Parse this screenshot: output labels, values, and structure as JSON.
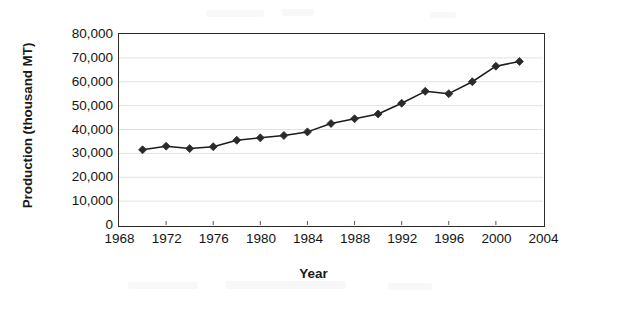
{
  "chart_data": {
    "type": "line",
    "title": "",
    "subtitle": "",
    "xlabel": "Year",
    "ylabel": "Production (thousand MT)",
    "xlim": [
      1968,
      2004
    ],
    "ylim": [
      0,
      80000
    ],
    "xticks": [
      1968,
      1972,
      1976,
      1980,
      1984,
      1988,
      1992,
      1996,
      2000,
      2004
    ],
    "xtick_labels": [
      "1968",
      "1972",
      "1976",
      "1980",
      "1984",
      "1988",
      "1992",
      "1996",
      "2000",
      "2004"
    ],
    "yticks": [
      0,
      10000,
      20000,
      30000,
      40000,
      50000,
      60000,
      70000,
      80000
    ],
    "ytick_labels": [
      "0",
      "10,000",
      "20,000",
      "30,000",
      "40,000",
      "50,000",
      "60,000",
      "70,000",
      "80,000"
    ],
    "grid": true,
    "grid_axis": "y",
    "legend": false,
    "legend_position": "none",
    "marker": "diamond",
    "line_color": "#1c1c1c",
    "marker_color": "#2a2a2a",
    "grid_color": "#e2e2e2",
    "axis_color": "#2b2b2b",
    "x": [
      1970,
      1972,
      1974,
      1976,
      1978,
      1980,
      1982,
      1984,
      1986,
      1988,
      1990,
      1992,
      1994,
      1996,
      1998,
      2000,
      2002
    ],
    "values": [
      31500,
      33000,
      32000,
      32800,
      35500,
      36500,
      37500,
      39000,
      42500,
      44500,
      46500,
      51000,
      56000,
      55000,
      60000,
      66500,
      68500
    ],
    "series": [
      {
        "name": "Production",
        "values": [
          31500,
          33000,
          32000,
          32800,
          35500,
          36500,
          37500,
          39000,
          42500,
          44500,
          46500,
          51000,
          56000,
          55000,
          60000,
          66500,
          68500
        ]
      }
    ]
  },
  "axes": {
    "y_title": "Production (thousand MT)",
    "x_title": "Year"
  }
}
